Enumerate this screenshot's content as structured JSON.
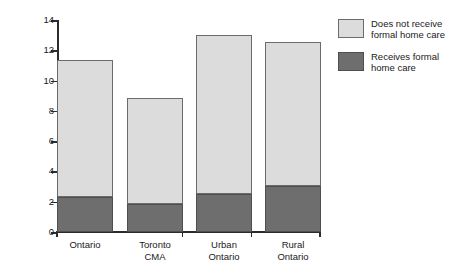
{
  "chart_data": {
    "type": "bar",
    "subtype": "stacked-vertical",
    "title": "",
    "subtitle": "",
    "xlabel": "",
    "ylabel": "% of total population",
    "ylim": [
      0,
      14
    ],
    "ytick_step": 2,
    "yticks": [
      0,
      2,
      4,
      6,
      8,
      10,
      12,
      14
    ],
    "ytick_labels": [
      "0",
      "2",
      "4",
      "6",
      "8",
      "10",
      "12",
      "14"
    ],
    "grid": false,
    "legend_position": "right",
    "categories": [
      "Ontario",
      "Toronto CMA",
      "Urban Ontario",
      "Rural Ontario"
    ],
    "category_labels_multiline": [
      "Ontario",
      "Toronto\nCMA",
      "Urban\nOntario",
      "Rural\nOntario"
    ],
    "series": [
      {
        "name": "Receives formal home care",
        "color": "#6e6e6e",
        "values": [
          2.3,
          1.8,
          2.5,
          3.0
        ]
      },
      {
        "name": "Does not receive formal home care",
        "color": "#dcdcdc",
        "values": [
          9.0,
          7.0,
          10.5,
          9.5
        ]
      }
    ],
    "totals": [
      11.3,
      8.8,
      13.0,
      12.5
    ],
    "stack_order_bottom_to_top": [
      "Receives formal home care",
      "Does not receive formal home care"
    ],
    "annotations": []
  },
  "legend": {
    "items": [
      {
        "label": "Does not receive\nformal home care",
        "swatch": "light"
      },
      {
        "label": "Receives formal\nhome care",
        "swatch": "dark"
      }
    ]
  },
  "colors": {
    "light_gray": "#dcdcdc",
    "dark_gray": "#6e6e6e",
    "axis": "#2b2b2b",
    "background": "#ffffff"
  }
}
